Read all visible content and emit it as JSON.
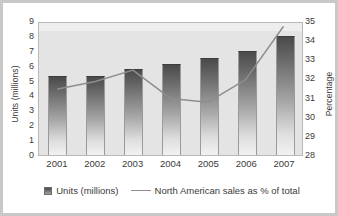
{
  "chart_data": {
    "type": "bar",
    "title": "",
    "subtitle": "",
    "categories": [
      "2001",
      "2002",
      "2003",
      "2004",
      "2005",
      "2006",
      "2007"
    ],
    "xlabel": "",
    "ylabel": "Units (millions)",
    "y2label": "Percentage",
    "ylim": [
      0,
      9
    ],
    "y2lim": [
      28,
      35
    ],
    "yticks": [
      "9",
      "8",
      "7",
      "6",
      "5",
      "4",
      "3",
      "2",
      "1",
      "0"
    ],
    "y2ticks": [
      "35",
      "34",
      "33",
      "32",
      "31",
      "30",
      "29",
      "28"
    ],
    "grid": false,
    "legend_position": "bottom",
    "series": [
      {
        "name": "Units (millions)",
        "type": "bar",
        "axis": "left",
        "values": [
          5.3,
          5.3,
          5.8,
          6.1,
          6.5,
          7.0,
          8.0
        ]
      },
      {
        "name": "North American sales as % of total",
        "type": "line",
        "axis": "right",
        "values": [
          31.5,
          31.9,
          32.5,
          31.0,
          30.8,
          32.0,
          34.8
        ]
      }
    ]
  },
  "legend": {
    "entries": [
      {
        "label": "Units (millions)",
        "marker": "bar-swatch"
      },
      {
        "label": "North American sales as % of total",
        "marker": "line-swatch"
      }
    ]
  },
  "colors": {
    "bar_top": "#4a4a4a",
    "bar_bottom": "#f2f2f2",
    "line": "#8e8e8e",
    "plot_background": "#e4e4e4",
    "figure_background": "#ffffff",
    "frame": "#c9c9c9",
    "text": "#3a3a3a"
  }
}
